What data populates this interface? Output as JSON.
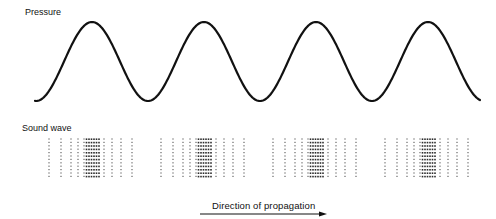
{
  "labels": {
    "pressure": "Pressure",
    "sound_wave": "Sound wave",
    "direction": "Direction of propagation"
  },
  "pressure_wave": {
    "x_start": 35,
    "x_end": 480,
    "baseline_trough_y": 101,
    "peak_y": 22,
    "period_px": 112,
    "peak_x": [
      92,
      204,
      316,
      428
    ],
    "stroke_color": "#111111",
    "stroke_width": 2.2
  },
  "sound_wave": {
    "compression_centers_x": [
      92,
      204,
      316,
      428
    ],
    "column_offsets": [
      -43,
      -31,
      -21,
      -14,
      -8,
      -5.5,
      -3,
      -0.5,
      2,
      4.5,
      7,
      12,
      20,
      29,
      40
    ],
    "row_top_y": 139,
    "row_count": 12,
    "row_spacing": 3.4,
    "dot_color": "#222222"
  },
  "arrow": {
    "x1": 200,
    "x2": 327,
    "y": 214,
    "color": "#111111"
  }
}
